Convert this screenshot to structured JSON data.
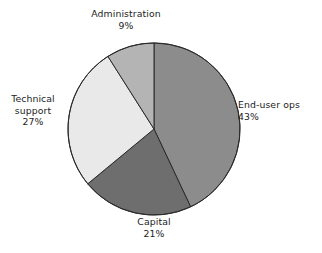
{
  "chart_data": {
    "type": "pie",
    "title": "",
    "subtitle": "",
    "xlabel": "",
    "ylabel": "",
    "legend_position": "none",
    "grid": false,
    "unit": "%",
    "start_angle_deg": 0,
    "direction": "clockwise",
    "categories": [
      "End-user ops",
      "Capital",
      "Technical support",
      "Administration"
    ],
    "values": [
      43,
      21,
      27,
      9
    ],
    "slices": [
      {
        "label": "End-user ops",
        "label_line1": "End-user ops",
        "value_text": "43%",
        "value": 43,
        "color": "#8c8c8c",
        "start_deg": 0,
        "end_deg": 154.8
      },
      {
        "label": "Capital",
        "label_line1": "Capital",
        "value_text": "21%",
        "value": 21,
        "color": "#6e6e6e",
        "start_deg": 154.8,
        "end_deg": 230.4
      },
      {
        "label": "Technical support",
        "label_line1": "Technical",
        "label_line2": "support",
        "value_text": "27%",
        "value": 27,
        "color": "#e9e9e9",
        "start_deg": 230.4,
        "end_deg": 327.6
      },
      {
        "label": "Administration",
        "label_line1": "Administration",
        "value_text": "9%",
        "value": 9,
        "color": "#b4b4b4",
        "start_deg": 327.6,
        "end_deg": 360
      }
    ],
    "geometry": {
      "center_x": 154,
      "center_y": 129,
      "radius": 86
    },
    "colors": {
      "background": "#ffffff",
      "outline": "#2b2b2b",
      "text": "#1c1c1c"
    }
  }
}
